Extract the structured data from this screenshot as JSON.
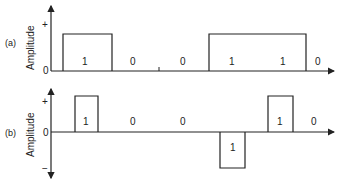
{
  "diagram": {
    "type": "line-coding-waveforms",
    "stroke_color": "#222222",
    "background": "#ffffff",
    "panels": [
      {
        "id": "a",
        "label": "(a)",
        "ylabel": "Amplitude",
        "y_ticks": {
          "plus": "+",
          "zero": "0"
        },
        "bits": [
          "1",
          "0",
          "0",
          "1",
          "1",
          "0"
        ],
        "encoding": "unipolar NRZ"
      },
      {
        "id": "b",
        "label": "(b)",
        "ylabel": "Amplitude",
        "y_ticks": {
          "plus": "+",
          "zero": "0",
          "minus": "−"
        },
        "bits": [
          "1",
          "0",
          "0",
          "1",
          "1",
          "0"
        ],
        "encoding": "bipolar RZ (AMI)"
      }
    ]
  }
}
